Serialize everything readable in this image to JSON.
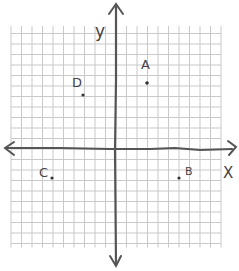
{
  "diagram": {
    "type": "coordinate-plane",
    "axis_labels": {
      "x": "X",
      "y": "y"
    },
    "grid": {
      "cols": 21,
      "rows": 21,
      "origin_px": [
        116,
        149
      ],
      "cell_px": 10.5
    },
    "points": [
      {
        "label": "A",
        "x": 3,
        "y": 6
      },
      {
        "label": "B",
        "x": 6,
        "y": -3
      },
      {
        "label": "C",
        "x": -6,
        "y": -3
      },
      {
        "label": "D",
        "x": -3,
        "y": 5
      }
    ],
    "colors": {
      "grid": "#c9c9c9",
      "axis": "#555555",
      "ink": "#444444",
      "background": "#ffffff"
    }
  }
}
